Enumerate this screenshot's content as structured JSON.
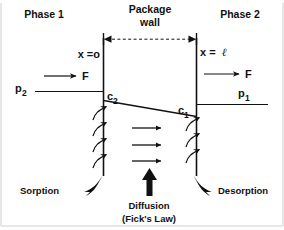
{
  "diagram": {
    "title_text": "Permeation through a package wall",
    "regions": {
      "phase_left_label": "Phase 1",
      "phase_right_label": "Phase 2",
      "wall_label_line1": "Package",
      "wall_label_line2": "wall"
    },
    "axis_labels": {
      "left_wall_position": "x =o",
      "right_wall_position_prefix": "x = ",
      "right_wall_position_symbol": "ℓ"
    },
    "flux_labels": {
      "left_flux": "F",
      "right_flux": "F"
    },
    "pressure_labels": {
      "left_pressure_base": "p",
      "left_pressure_sub": "2",
      "right_pressure_base": "p",
      "right_pressure_sub": "1"
    },
    "concentration_labels": {
      "left_conc_base": "c",
      "left_conc_sub": "2",
      "right_conc_base": "c",
      "right_conc_sub": "1"
    },
    "process_labels": {
      "sorption": "Sorption",
      "diffusion_line1": "Diffusion",
      "diffusion_line2": "(Fick's Law)",
      "desorption": "Desorption"
    },
    "colors": {
      "ink": "#111111",
      "background": "#ffffff",
      "frame": "#cfcfcf"
    },
    "geometry": {
      "left_wall_x": 103,
      "right_wall_x": 197,
      "wall_top_y": 38,
      "wall_bottom_y": 176,
      "sorption_arrow_count": 4,
      "diffusion_arrow_count": 3,
      "desorption_arrow_count": 3
    }
  }
}
